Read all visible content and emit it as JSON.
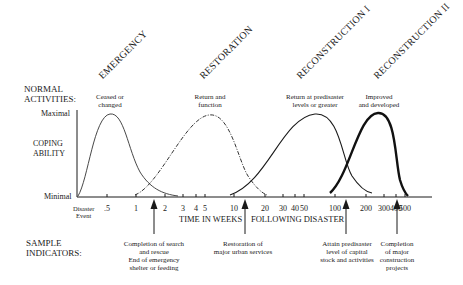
{
  "left_labels": {
    "normal_activities": [
      "NORMAL",
      "ACTIVITIES:"
    ],
    "coping_ability": [
      "COPING",
      "ABILITY"
    ],
    "maximal": "Maximal",
    "minimal": "Minimal",
    "sample_indicators": [
      "SAMPLE",
      "INDICATORS:"
    ],
    "disaster_event": [
      "Disaster",
      "Event"
    ]
  },
  "phases": [
    {
      "name": "EMERGENCY",
      "activity": [
        "Ceased or",
        "changed"
      ],
      "line_style": "thin-solid"
    },
    {
      "name": "RESTORATION",
      "activity": [
        "Return and",
        "function"
      ],
      "line_style": "dash-dot"
    },
    {
      "name": "RECONSTRUCTION I",
      "activity": [
        "Return at predisaster",
        "levels or greater"
      ],
      "line_style": "solid"
    },
    {
      "name": "RECONSTRUCTION II",
      "activity": [
        "Improved",
        "and developed"
      ],
      "line_style": "thick-solid"
    }
  ],
  "axis": {
    "x_title_left": "TIME IN WEEKS",
    "x_title_right": "FOLLOWING DISASTER",
    "ticks": [
      ".5",
      "1",
      "2",
      "3",
      "4",
      "5",
      "10",
      "20",
      "30",
      "40",
      "50",
      "100",
      "200",
      "300",
      "400",
      "500"
    ],
    "scale": "logarithmic"
  },
  "indicators": [
    {
      "lines": [
        "Completion of search",
        "and rescue",
        "End of emergency",
        "shelter or feeding"
      ],
      "at_weeks": 1.5
    },
    {
      "lines": [
        "Restoration of",
        "major urban services"
      ],
      "at_weeks": 12
    },
    {
      "lines": [
        "Attain predisaster",
        "level of capital",
        "stock and activities"
      ],
      "at_weeks": 120
    },
    {
      "lines": [
        "Completion",
        "of major",
        "construction",
        "projects"
      ],
      "at_weeks": 400
    }
  ]
}
